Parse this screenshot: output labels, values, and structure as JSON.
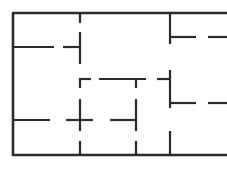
{
  "diagram": {
    "type": "architectural-floor-plan",
    "canvas": {
      "width": 227,
      "height": 181
    },
    "style": {
      "background": "#ffffff",
      "wall_color": "#2b2b2b",
      "exterior_wall_thickness": 2.6,
      "interior_wall_thickness": 2.2
    },
    "exterior_walls": [
      {
        "name": "top-exterior-wall",
        "orientation": "horizontal",
        "x1": 12,
        "y1": 13,
        "x2": 227,
        "y2": 13
      },
      {
        "name": "left-exterior-wall",
        "orientation": "vertical",
        "x1": 13,
        "y1": 13,
        "x2": 13,
        "y2": 156
      },
      {
        "name": "bottom-exterior-wall",
        "orientation": "horizontal",
        "x1": 12,
        "y1": 155,
        "x2": 227,
        "y2": 155
      }
    ],
    "interior_walls": [
      {
        "name": "upper-left-partition-upper",
        "orientation": "vertical",
        "x1": 80,
        "y1": 13,
        "x2": 80,
        "y2": 23
      },
      {
        "name": "upper-left-partition-lower",
        "orientation": "vertical",
        "x1": 80,
        "y1": 32,
        "x2": 80,
        "y2": 64
      },
      {
        "name": "upper-left-divider-west",
        "orientation": "horizontal",
        "x1": 13,
        "y1": 47,
        "x2": 54,
        "y2": 47
      },
      {
        "name": "upper-left-divider-east",
        "orientation": "horizontal",
        "x1": 63,
        "y1": 47,
        "x2": 81,
        "y2": 47
      },
      {
        "name": "right-wing-partition-upper",
        "orientation": "vertical",
        "x1": 170,
        "y1": 13,
        "x2": 170,
        "y2": 44
      },
      {
        "name": "right-wing-stub-upper",
        "orientation": "horizontal",
        "x1": 170,
        "y1": 37,
        "x2": 196,
        "y2": 37
      },
      {
        "name": "right-wing-stub-upper-far",
        "orientation": "horizontal",
        "x1": 208,
        "y1": 37,
        "x2": 227,
        "y2": 37
      },
      {
        "name": "right-wing-partition-middle",
        "orientation": "vertical",
        "x1": 170,
        "y1": 70,
        "x2": 170,
        "y2": 108
      },
      {
        "name": "right-wing-stub-mid-left",
        "orientation": "horizontal",
        "x1": 157,
        "y1": 79,
        "x2": 171,
        "y2": 79
      },
      {
        "name": "right-wing-stub-mid-right",
        "orientation": "horizontal",
        "x1": 170,
        "y1": 103,
        "x2": 196,
        "y2": 103
      },
      {
        "name": "right-wing-stub-mid-far",
        "orientation": "horizontal",
        "x1": 208,
        "y1": 103,
        "x2": 227,
        "y2": 103
      },
      {
        "name": "right-wing-partition-lower",
        "orientation": "vertical",
        "x1": 170,
        "y1": 131,
        "x2": 170,
        "y2": 155
      },
      {
        "name": "center-room-top-west",
        "orientation": "horizontal",
        "x1": 80,
        "y1": 79,
        "x2": 91,
        "y2": 79
      },
      {
        "name": "center-room-top-east",
        "orientation": "horizontal",
        "x1": 99,
        "y1": 79,
        "x2": 146,
        "y2": 79
      },
      {
        "name": "center-room-west-wall-upper",
        "orientation": "vertical",
        "x1": 80,
        "y1": 78,
        "x2": 80,
        "y2": 88
      },
      {
        "name": "center-room-west-wall-lower",
        "orientation": "vertical",
        "x1": 80,
        "y1": 99,
        "x2": 80,
        "y2": 131
      },
      {
        "name": "center-room-east-wall-upper",
        "orientation": "vertical",
        "x1": 136,
        "y1": 78,
        "x2": 136,
        "y2": 88
      },
      {
        "name": "center-room-east-wall-lower",
        "orientation": "vertical",
        "x1": 136,
        "y1": 99,
        "x2": 136,
        "y2": 131
      },
      {
        "name": "lower-left-divider-west",
        "orientation": "horizontal",
        "x1": 13,
        "y1": 120,
        "x2": 50,
        "y2": 120
      },
      {
        "name": "lower-left-divider-east",
        "orientation": "horizontal",
        "x1": 66,
        "y1": 120,
        "x2": 93,
        "y2": 120
      },
      {
        "name": "lower-center-divider",
        "orientation": "horizontal",
        "x1": 110,
        "y1": 120,
        "x2": 137,
        "y2": 120
      },
      {
        "name": "bottom-stub-left",
        "orientation": "vertical",
        "x1": 80,
        "y1": 141,
        "x2": 80,
        "y2": 155
      },
      {
        "name": "bottom-stub-center",
        "orientation": "vertical",
        "x1": 136,
        "y1": 141,
        "x2": 136,
        "y2": 155
      }
    ]
  }
}
